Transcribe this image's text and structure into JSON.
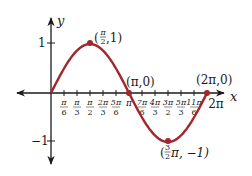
{
  "chart_data": {
    "type": "line",
    "title": "",
    "function": "y = sin x",
    "xlabel": "x",
    "ylabel": "y",
    "xlim": [
      0,
      6.2832
    ],
    "ylim": [
      -1,
      1
    ],
    "grid": false,
    "x_tick_labels": [
      "π/6",
      "π/3",
      "π/2",
      "2π/3",
      "5π/6",
      "π",
      "7π/6",
      "4π/3",
      "3π/2",
      "5π/3",
      "11π/6",
      "2π"
    ],
    "y_tick_labels": [
      "1",
      "−1"
    ],
    "x": [
      0,
      0.5236,
      1.0472,
      1.5708,
      2.0944,
      2.618,
      3.1416,
      3.6652,
      4.1888,
      4.7124,
      5.236,
      5.7596,
      6.2832
    ],
    "series": [
      {
        "name": "sin x",
        "color": "#a0282d",
        "values": [
          0,
          0.5,
          0.866,
          1,
          0.866,
          0.5,
          0,
          -0.5,
          -0.866,
          -1,
          -0.866,
          -0.5,
          0
        ]
      }
    ],
    "annotations": [
      {
        "point": "(π/2, 1)",
        "x": 1.5708,
        "y": 1
      },
      {
        "point": "(π, 0)",
        "x": 3.1416,
        "y": 0
      },
      {
        "point": "(3/2 π, −1)",
        "x": 4.7124,
        "y": -1
      },
      {
        "point": "(2π, 0)",
        "x": 6.2832,
        "y": 0
      }
    ]
  },
  "labels": {
    "x_axis": "x",
    "y_axis": "y",
    "y_one": "1",
    "y_neg_one": "−1",
    "pt_peak_open": "(",
    "pt_peak_close": ",1)",
    "pt_pi": "(π,0)",
    "pt_trough_open": "(",
    "pt_trough_tail": "π, −1)",
    "pt_2pi": "(2π,0)",
    "tick_2pi": "2π"
  },
  "colors": {
    "curve": "#a0282d",
    "axis": "#1a1a1a"
  }
}
